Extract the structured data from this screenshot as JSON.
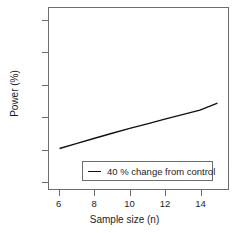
{
  "chart_data": {
    "type": "line",
    "title": "",
    "xlabel": "Sample size (n)",
    "ylabel": "Power (%)",
    "xlim": [
      5.4,
      15.6
    ],
    "ylim": [
      -5,
      108
    ],
    "xticks": [
      6,
      8,
      10,
      12,
      14
    ],
    "xtick_labels": [
      "6",
      "8",
      "10",
      "12",
      "14"
    ],
    "yticks": [
      0,
      20,
      40,
      60,
      80,
      100
    ],
    "ytick_labels": [
      "0",
      "20",
      "40",
      "60",
      "80",
      "100"
    ],
    "grid": false,
    "legend_position": "lower center",
    "series": [
      {
        "name": "40 % change from control",
        "color": "#111111",
        "x": [
          6,
          7,
          8,
          9,
          10,
          11,
          12,
          13,
          14,
          15
        ],
        "values": [
          20.3,
          23.5,
          26.7,
          29.8,
          32.8,
          35.7,
          38.6,
          41.4,
          44.2,
          48.6
        ]
      }
    ],
    "legend": [
      {
        "label": "40 % change from control",
        "color": "#111111",
        "marker": "line"
      }
    ],
    "axis_color": "#6d6d6d",
    "background": "#ffffff"
  }
}
